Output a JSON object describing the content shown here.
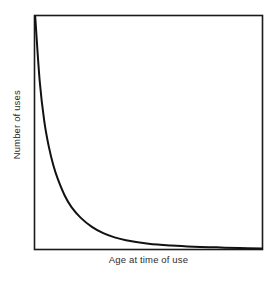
{
  "chart_data": {
    "type": "line",
    "title": "",
    "subtitle": "",
    "xlabel": "Age at time of use",
    "ylabel": "Number of uses",
    "grid": false,
    "legend": null,
    "legend_position": "none",
    "axis_tick_labels": {
      "x": [],
      "y": []
    },
    "xlim": [
      0,
      100
    ],
    "ylim": [
      0,
      100
    ],
    "annotations": [],
    "series": [
      {
        "name": "Uses by age",
        "description": "Exponential decay curve, steeply falling from maximum at the youngest age and flattening asymptotically toward zero",
        "color": "#111111",
        "line_width": 2,
        "x": [
          0,
          2,
          4,
          6,
          8,
          10,
          13,
          16,
          20,
          25,
          30,
          35,
          40,
          50,
          60,
          70,
          80,
          90,
          100
        ],
        "y": [
          100,
          72,
          55,
          44,
          36,
          30,
          23,
          18,
          13.5,
          9.5,
          6.8,
          5.0,
          3.8,
          2.3,
          1.5,
          1.0,
          0.7,
          0.4,
          0.2
        ]
      }
    ],
    "frame": {
      "box_visible": true,
      "box_color": "#1a1a1a",
      "background": "#ffffff"
    }
  },
  "figure": {
    "background_color": "#ffffff",
    "width_px": 277,
    "height_px": 283
  }
}
